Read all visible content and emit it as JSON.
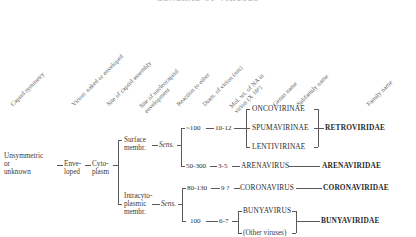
{
  "figure": {
    "title": "GENERAL OF VIRUSES",
    "headers": [
      {
        "id": "capsid-symmetry",
        "line1": "Capsid symmetry",
        "line2": ""
      },
      {
        "id": "virion-naked-enveloped",
        "line1": "Virion: naked or enveloped",
        "line2": ""
      },
      {
        "id": "site-capsid-assembly",
        "line1": "Site of capsid assembly",
        "line2": ""
      },
      {
        "id": "site-nucleocapsid-envelopment",
        "line1": "Site of nucleocapsid",
        "line2": "envelopment"
      },
      {
        "id": "reaction-to-ether",
        "line1": "Reaction to ether",
        "line2": ""
      },
      {
        "id": "diam-of-virion",
        "line1": "Diam. of virion (nm)",
        "line2": ""
      },
      {
        "id": "mol-wt-na-virion",
        "line1": "Mol. wt. of NA in",
        "line2": "virion (X 10⁶)"
      },
      {
        "id": "genus-name",
        "line1": "Genus name",
        "line2": ""
      },
      {
        "id": "subfamily-name",
        "line1": "Subfamily name",
        "line2": ""
      },
      {
        "id": "family-name",
        "line1": "Family name",
        "line2": ""
      }
    ],
    "tree": {
      "root": {
        "line1": "Unsymmetric",
        "line2": "or",
        "line3": "unknown"
      },
      "enveloped": {
        "line1": "Enve-",
        "line2": "loped"
      },
      "cytoplasm": {
        "line1": "Cyto-",
        "line2": "plasm"
      },
      "branch_surface": {
        "line1": "Surface",
        "line2": "membr."
      },
      "branch_intracyto": {
        "line1": "Intracyto-",
        "line2": "plasmic",
        "line3": "membr."
      },
      "sens_upper": "Sens.",
      "sens_lower": "Sens."
    },
    "rows": [
      {
        "id": "retroviridae",
        "diameter": "~100",
        "mol_wt": "10-12",
        "genera": [
          "ONCOVIRINAE",
          "SPUMAVIRINAE",
          "LENTIVIRINAE"
        ],
        "family": "RETROVIRIDAE"
      },
      {
        "id": "arenaviridae",
        "diameter": "50-300",
        "mol_wt": "3-5",
        "genera": [
          "ARENAVIRUS"
        ],
        "family": "ARENAVIRIDAE"
      },
      {
        "id": "coronaviridae",
        "diameter": "80-130",
        "mol_wt": "9 ?",
        "genera": [
          "CORONAVIRUS"
        ],
        "family": "CORONAVIRIDAE"
      },
      {
        "id": "bunyaviridae",
        "diameter": "100",
        "mol_wt": "6-7",
        "genera": [
          "BUNYAVIRUS",
          "(Other viruses)"
        ],
        "family": "BUNYAVIRIDAE"
      }
    ]
  }
}
